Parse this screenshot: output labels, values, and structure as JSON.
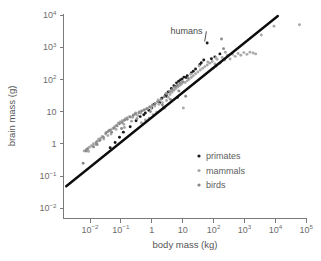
{
  "chart_data": {
    "type": "scatter",
    "title": "",
    "xlabel": "body mass (kg)",
    "ylabel": "brain mass (g)",
    "xscale": "log",
    "yscale": "log",
    "xlim": [
      0.0016,
      100000
    ],
    "ylim": [
      0.01,
      10000
    ],
    "grid": false,
    "xticks": [
      {
        "value": 0.01,
        "mantissa": "10",
        "exponent": "−2"
      },
      {
        "value": 0.1,
        "mantissa": "10",
        "exponent": "−1"
      },
      {
        "value": 1,
        "mantissa": "1",
        "exponent": ""
      },
      {
        "value": 10,
        "mantissa": "10",
        "exponent": ""
      },
      {
        "value": 100,
        "mantissa": "10",
        "exponent": "2"
      },
      {
        "value": 1000,
        "mantissa": "10",
        "exponent": "3"
      },
      {
        "value": 10000,
        "mantissa": "10",
        "exponent": "4"
      },
      {
        "value": 100000,
        "mantissa": "10",
        "exponent": "5"
      }
    ],
    "yticks": [
      {
        "value": 10000,
        "mantissa": "10",
        "exponent": "4"
      },
      {
        "value": 1000,
        "mantissa": "10",
        "exponent": "3"
      },
      {
        "value": 100,
        "mantissa": "10",
        "exponent": "2"
      },
      {
        "value": 10,
        "mantissa": "10",
        "exponent": ""
      },
      {
        "value": 1,
        "mantissa": "1",
        "exponent": ""
      },
      {
        "value": 0.1,
        "mantissa": "10",
        "exponent": "−1"
      },
      {
        "value": 0.01,
        "mantissa": "10",
        "exponent": "−2"
      }
    ],
    "legend": {
      "position": "lower-right-inside",
      "entries": [
        {
          "label": "primates",
          "color": "#1a1a1a",
          "marker": "dot"
        },
        {
          "label": "mammals",
          "color": "#a8a8a8",
          "marker": "dot"
        },
        {
          "label": "birds",
          "color": "#888888",
          "marker": "dot"
        }
      ]
    },
    "annotations": [
      {
        "text": "humans",
        "label_x": 4.0,
        "label_y": 2600,
        "point_x": 62,
        "point_y": 1350,
        "leader": true
      }
    ],
    "trendline": {
      "label": "allometric regression",
      "color": "#0d0d0d",
      "x_start": 0.0017,
      "y_start": 0.048,
      "x_end": 12000,
      "y_end": 9300
    },
    "series": [
      {
        "name": "primates",
        "color": "#1a1a1a",
        "points": [
          [
            0.065,
            1.1
          ],
          [
            0.09,
            1.6
          ],
          [
            0.12,
            2.3
          ],
          [
            0.2,
            3.4
          ],
          [
            0.31,
            5.2
          ],
          [
            0.42,
            7.0
          ],
          [
            0.62,
            9.0
          ],
          [
            0.8,
            11.0
          ],
          [
            1.0,
            13.0
          ],
          [
            1.2,
            17.0
          ],
          [
            1.6,
            21.0
          ],
          [
            2.1,
            26.0
          ],
          [
            2.8,
            33.0
          ],
          [
            3.4,
            41.0
          ],
          [
            4.3,
            52.0
          ],
          [
            5.2,
            64.0
          ],
          [
            6.3,
            78.0
          ],
          [
            7.4,
            88.0
          ],
          [
            8.5,
            97.0
          ],
          [
            9.6,
            104.0
          ],
          [
            11.0,
            118.0
          ],
          [
            14.0,
            130.0
          ],
          [
            19.0,
            160.0
          ],
          [
            26.0,
            210.0
          ],
          [
            36.0,
            290.0
          ],
          [
            48.0,
            400.0
          ],
          [
            62.0,
            1350.0
          ],
          [
            85.0,
            440.0
          ],
          [
            110.0,
            500.0
          ],
          [
            160.0,
            620.0
          ],
          [
            0.045,
            0.75
          ],
          [
            0.55,
            8.0
          ],
          [
            1.8,
            19.0
          ],
          [
            3.0,
            30.0
          ],
          [
            5.8,
            60.0
          ],
          [
            13.0,
            115.0
          ],
          [
            22.0,
            180.0
          ],
          [
            40.0,
            330.0
          ],
          [
            2.4,
            13.0
          ],
          [
            6.8,
            28.0
          ]
        ]
      },
      {
        "name": "mammals",
        "color": "#a9a9a9",
        "points": [
          [
            0.0085,
            0.72
          ],
          [
            0.0095,
            0.78
          ],
          [
            0.011,
            0.85
          ],
          [
            0.012,
            0.9
          ],
          [
            0.013,
            1.0
          ],
          [
            0.015,
            0.95
          ],
          [
            0.017,
            1.2
          ],
          [
            0.019,
            1.4
          ],
          [
            0.022,
            1.5
          ],
          [
            0.025,
            1.7
          ],
          [
            0.028,
            1.4
          ],
          [
            0.032,
            2.0
          ],
          [
            0.036,
            2.3
          ],
          [
            0.042,
            2.6
          ],
          [
            0.048,
            2.0
          ],
          [
            0.055,
            3.0
          ],
          [
            0.063,
            3.4
          ],
          [
            0.072,
            3.8
          ],
          [
            0.082,
            4.4
          ],
          [
            0.095,
            4.8
          ],
          [
            0.11,
            5.2
          ],
          [
            0.125,
            4.0
          ],
          [
            0.14,
            6.0
          ],
          [
            0.16,
            6.5
          ],
          [
            0.19,
            7.0
          ],
          [
            0.22,
            5.0
          ],
          [
            0.26,
            8.0
          ],
          [
            0.3,
            9.0
          ],
          [
            0.35,
            7.5
          ],
          [
            0.4,
            10.0
          ],
          [
            0.46,
            4.5
          ],
          [
            0.55,
            11.0
          ],
          [
            0.62,
            5.5
          ],
          [
            0.72,
            12.0
          ],
          [
            0.82,
            6.2
          ],
          [
            0.95,
            13.0
          ],
          [
            1.1,
            8.0
          ],
          [
            1.25,
            15.0
          ],
          [
            1.45,
            9.5
          ],
          [
            1.7,
            17.0
          ],
          [
            1.95,
            11.0
          ],
          [
            2.2,
            19.0
          ],
          [
            2.6,
            13.0
          ],
          [
            3.0,
            22.0
          ],
          [
            3.4,
            28.0
          ],
          [
            3.9,
            34.0
          ],
          [
            4.5,
            40.0
          ],
          [
            5.2,
            46.0
          ],
          [
            6.0,
            52.0
          ],
          [
            6.9,
            58.0
          ],
          [
            7.9,
            64.0
          ],
          [
            9.0,
            70.0
          ],
          [
            10.5,
            13.0
          ],
          [
            12.0,
            80.0
          ],
          [
            14.0,
            90.0
          ],
          [
            16.0,
            100.0
          ],
          [
            19.0,
            115.0
          ],
          [
            22.0,
            130.0
          ],
          [
            26.0,
            150.0
          ],
          [
            31.0,
            170.0
          ],
          [
            37.0,
            195.0
          ],
          [
            44.0,
            220.0
          ],
          [
            52.0,
            250.0
          ],
          [
            62.0,
            280.0
          ],
          [
            75.0,
            320.0
          ],
          [
            90.0,
            360.0
          ],
          [
            110.0,
            300.0
          ],
          [
            130.0,
            420.0
          ],
          [
            160.0,
            320.0
          ],
          [
            190.0,
            480.0
          ],
          [
            230.0,
            400.0
          ],
          [
            280.0,
            560.0
          ],
          [
            340.0,
            430.0
          ],
          [
            410.0,
            600.0
          ],
          [
            500.0,
            520.0
          ],
          [
            620.0,
            640.0
          ],
          [
            760.0,
            560.0
          ],
          [
            950.0,
            680.0
          ],
          [
            1200.0,
            600.0
          ],
          [
            1500.0,
            700.0
          ],
          [
            1900.0,
            660.0
          ],
          [
            2300.0,
            620.0
          ],
          [
            3500.0,
            2400.0
          ],
          [
            9000.0,
            4500.0
          ],
          [
            60000.0,
            5000.0
          ],
          [
            0.0065,
            0.6
          ],
          [
            0.0075,
            0.66
          ],
          [
            0.009,
            0.58
          ],
          [
            0.02,
            1.25
          ],
          [
            0.038,
            1.8
          ],
          [
            0.07,
            2.8
          ],
          [
            0.13,
            3.2
          ],
          [
            0.24,
            6.6
          ],
          [
            0.44,
            9.0
          ],
          [
            0.85,
            14.0
          ],
          [
            1.6,
            23.0
          ],
          [
            2.9,
            37.0
          ],
          [
            5.5,
            55.0
          ],
          [
            9.8,
            78.0
          ],
          [
            18.0,
            145.0
          ],
          [
            34.0,
            260.0
          ],
          [
            65.0,
            350.0
          ],
          [
            120.0,
            470.0
          ],
          [
            240.0,
            700.0
          ]
        ]
      },
      {
        "name": "birds",
        "color": "#8a8a8a",
        "points": [
          [
            0.006,
            0.25
          ],
          [
            0.0075,
            0.6
          ],
          [
            0.0082,
            0.68
          ],
          [
            0.013,
            0.8
          ],
          [
            0.016,
            1.1
          ],
          [
            0.021,
            1.3
          ],
          [
            0.027,
            1.6
          ],
          [
            0.033,
            2.2
          ],
          [
            0.04,
            2.5
          ],
          [
            0.05,
            2.3
          ],
          [
            0.06,
            3.1
          ],
          [
            0.075,
            3.6
          ],
          [
            0.09,
            4.2
          ],
          [
            0.11,
            4.6
          ],
          [
            0.13,
            5.4
          ],
          [
            0.16,
            5.8
          ],
          [
            0.2,
            6.8
          ],
          [
            0.25,
            7.6
          ],
          [
            0.3,
            8.4
          ],
          [
            0.38,
            9.2
          ],
          [
            0.47,
            10.5
          ],
          [
            0.58,
            11.5
          ],
          [
            0.7,
            12.5
          ],
          [
            0.88,
            14.0
          ],
          [
            1.05,
            16.0
          ],
          [
            1.3,
            18.0
          ],
          [
            1.6,
            20.0
          ],
          [
            2.0,
            24.0
          ],
          [
            2.5,
            29.0
          ],
          [
            3.1,
            35.0
          ],
          [
            3.8,
            42.0
          ],
          [
            4.6,
            48.0
          ],
          [
            5.6,
            58.0
          ],
          [
            6.8,
            66.0
          ],
          [
            8.2,
            75.0
          ],
          [
            10.0,
            85.0
          ],
          [
            12.5,
            30.0
          ],
          [
            15.0,
            110.0
          ],
          [
            0.017,
            0.95
          ],
          [
            0.046,
            2.7
          ],
          [
            0.105,
            3.0
          ],
          [
            0.33,
            6.0
          ],
          [
            0.9,
            10.0
          ],
          [
            2.2,
            16.0
          ],
          [
            4.0,
            24.0
          ],
          [
            7.5,
            44.0
          ],
          [
            120.0,
            260.0
          ],
          [
            180.0,
            1800.0
          ],
          [
            210.0,
            900.0
          ],
          [
            95.0,
            220.0
          ]
        ]
      }
    ]
  }
}
